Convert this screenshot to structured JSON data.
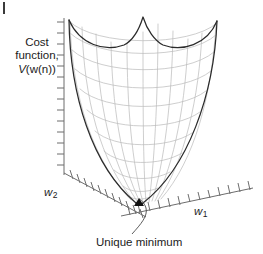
{
  "figure": {
    "type": "3d-surface-plot",
    "background_color": "#ffffff"
  },
  "labels": {
    "cost_axis": {
      "line1": "Cost",
      "line2": "function,",
      "line3_italic": "V",
      "line3_rest": "(w(n))",
      "full": "Cost function, V(w(n))"
    },
    "w2_axis": {
      "symbol": "w",
      "subscript": "2",
      "full": "w2"
    },
    "w1_axis": {
      "symbol": "w",
      "subscript": "1",
      "full": "w1"
    },
    "annotation": {
      "text": "Unique minimum"
    }
  },
  "colors": {
    "mesh": "#b9b9b9",
    "rim": "#2b2b2b",
    "axis": "#6d6d6d",
    "text": "#1b1b1b",
    "arrow": "#111111"
  },
  "axes": {
    "vertical_ticks": 14,
    "w2_ticks": 11,
    "w1_ticks": 13
  }
}
